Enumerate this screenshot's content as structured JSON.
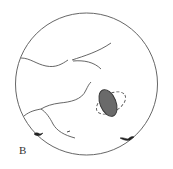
{
  "figure": {
    "panel_label": "B",
    "type": "fundus-view-diagram",
    "colors": {
      "outline": "#555555",
      "lesion_fill": "#6a6a6a",
      "background": "#ffffff"
    },
    "elements": [
      "field-of-view-circle",
      "blood-vessels",
      "dark-oval-lesion",
      "dashed-outline-halo",
      "pigment-spots"
    ]
  }
}
